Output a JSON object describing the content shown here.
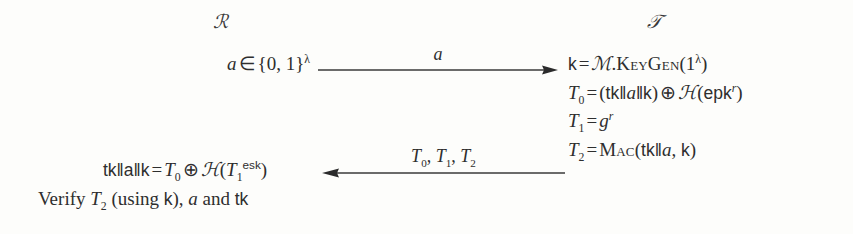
{
  "diagram": {
    "type": "protocol-message-sequence",
    "background_color": "#fdfdfb",
    "text_color": "#2e2e2e",
    "parties": {
      "left": {
        "name": "left-party-label",
        "symbol": "ℛ",
        "plain": "R"
      },
      "right": {
        "name": "right-party-label",
        "symbol": "𝒯",
        "plain": "T"
      }
    },
    "left_column": {
      "line1": {
        "full": "a ∈ {0,1}λ",
        "var": "a",
        "in": "∈",
        "set": "{0, 1}",
        "exp": "λ"
      },
      "line2": {
        "full": "tk‖a‖k = T0 ⊕ H(T1^esk)",
        "lhs": "tk‖a‖k",
        "eq": "=",
        "t0": "T",
        "t0sub": "0",
        "xor": "⊕",
        "hash": "ℋ",
        "t1": "T",
        "t1sub": "1",
        "t1sup": "esk"
      },
      "line3": {
        "full": "Verify T2 (using k), a and tk",
        "verify": "Verify",
        "t2": "T",
        "t2sub": "2",
        "using_open": "(using",
        "k": "k",
        "using_close": "),",
        "a": "a",
        "and": "and",
        "tk": "tk"
      }
    },
    "right_column": {
      "line1": {
        "full": "k = M.KeyGen(1λ)",
        "k": "k",
        "eq": "=",
        "mac_scheme": "ℳ",
        "dot": ".",
        "keygen": "KeyGen",
        "arg_open": "(1",
        "arg_exp": "λ",
        "arg_close": ")"
      },
      "line2": {
        "full": "T0 = (tk‖a‖k) ⊕ H(epk^r)",
        "t0": "T",
        "t0sub": "0",
        "eq": "=",
        "open": "(",
        "tk": "tk",
        "bar1": "‖",
        "a": "a",
        "bar2": "‖",
        "k": "k",
        "close": ")",
        "xor": "⊕",
        "hash": "ℋ",
        "h_open": "(",
        "epk": "epk",
        "r": "r",
        "h_close": ")"
      },
      "line3": {
        "full": "T1 = g^r",
        "t1": "T",
        "t1sub": "1",
        "eq": "=",
        "g": "g",
        "r": "r"
      },
      "line4": {
        "full": "T2 = Mac(tk‖a, k)",
        "t2": "T",
        "t2sub": "2",
        "eq": "=",
        "mac": "Mac",
        "open": "(",
        "tk": "tk",
        "bar": "‖",
        "a": "a",
        "comma": ",",
        "k": "k",
        "close": ")"
      }
    },
    "messages": [
      {
        "name": "message-arrow-request",
        "direction": "left-to-right",
        "label_full": "a",
        "label_var": "a"
      },
      {
        "name": "message-arrow-response",
        "direction": "right-to-left",
        "label_full": "T0, T1, T2",
        "t0": "T",
        "t0sub": "0",
        "sep1": ",",
        "t1": "T",
        "t1sub": "1",
        "sep2": ",",
        "t2": "T",
        "t2sub": "2"
      }
    ]
  }
}
